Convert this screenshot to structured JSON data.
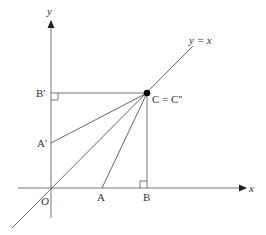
{
  "diagram": {
    "axes": {
      "x_label": "x",
      "y_label": "y",
      "origin_label": "O"
    },
    "line_label": "y = x",
    "points": {
      "A": "A",
      "B": "B",
      "A_prime": "A'",
      "B_prime": "B'",
      "C": "C = C''"
    },
    "colors": {
      "line": "#555555",
      "point": "#000000",
      "text": "#333333"
    }
  }
}
